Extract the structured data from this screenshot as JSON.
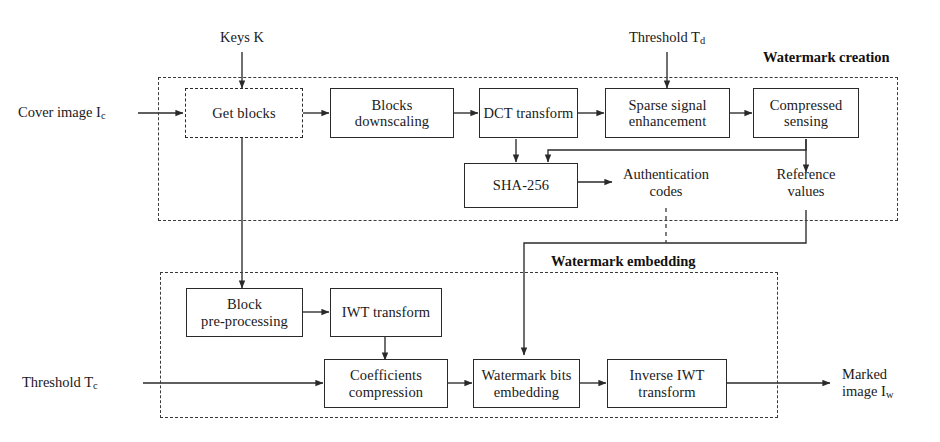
{
  "diagram": {
    "groups": [
      {
        "id": "watermark-creation",
        "label": "Watermark creation"
      },
      {
        "id": "watermark-embedding",
        "label": "Watermark embedding"
      }
    ],
    "nodes": [
      {
        "id": "get-blocks",
        "label": "Get blocks",
        "style": "dashed"
      },
      {
        "id": "blocks-downscaling",
        "label": "Blocks\ndownscaling",
        "style": "solid"
      },
      {
        "id": "dct-transform",
        "label": "DCT transform",
        "style": "solid"
      },
      {
        "id": "sparse-signal",
        "label": "Sparse signal\nenhancement",
        "style": "solid"
      },
      {
        "id": "compressed-sensing",
        "label": "Compressed\nsensing",
        "style": "solid"
      },
      {
        "id": "sha-256",
        "label": "SHA-256",
        "style": "solid"
      },
      {
        "id": "block-preprocessing",
        "label": "Block\npre-processing",
        "style": "solid"
      },
      {
        "id": "iwt-transform",
        "label": "IWT transform",
        "style": "solid"
      },
      {
        "id": "coefficients-compression",
        "label": "Coefficients\ncompression",
        "style": "solid"
      },
      {
        "id": "watermark-bits-embedding",
        "label": "Watermark bits\nembedding",
        "style": "solid"
      },
      {
        "id": "inverse-iwt-transform",
        "label": "Inverse IWT\ntransform",
        "style": "solid"
      }
    ],
    "labels": [
      {
        "id": "keys-k",
        "text": "Keys K"
      },
      {
        "id": "threshold-td",
        "text": "Threshold T",
        "sub": "d"
      },
      {
        "id": "cover-image",
        "text": "Cover image I",
        "sub": "c"
      },
      {
        "id": "authentication-codes",
        "text": "Authentication\ncodes"
      },
      {
        "id": "reference-values",
        "text": "Reference\nvalues"
      },
      {
        "id": "threshold-tc",
        "text": "Threshold T",
        "sub": "c"
      },
      {
        "id": "marked-image",
        "text": "Marked\nimage I",
        "sub": "w"
      }
    ],
    "edges": [
      {
        "from": "cover-image",
        "to": "get-blocks"
      },
      {
        "from": "keys-k",
        "to": "get-blocks"
      },
      {
        "from": "get-blocks",
        "to": "blocks-downscaling"
      },
      {
        "from": "get-blocks",
        "to": "block-preprocessing"
      },
      {
        "from": "blocks-downscaling",
        "to": "dct-transform"
      },
      {
        "from": "dct-transform",
        "to": "sparse-signal"
      },
      {
        "from": "dct-transform",
        "to": "sha-256"
      },
      {
        "from": "threshold-td",
        "to": "sparse-signal"
      },
      {
        "from": "sparse-signal",
        "to": "compressed-sensing"
      },
      {
        "from": "sparse-signal",
        "to": "sha-256"
      },
      {
        "from": "sha-256",
        "to": "authentication-codes"
      },
      {
        "from": "compressed-sensing",
        "to": "reference-values"
      },
      {
        "from": "reference-values",
        "to": "watermark-bits-embedding"
      },
      {
        "from": "block-preprocessing",
        "to": "iwt-transform"
      },
      {
        "from": "iwt-transform",
        "to": "coefficients-compression"
      },
      {
        "from": "threshold-tc",
        "to": "coefficients-compression"
      },
      {
        "from": "coefficients-compression",
        "to": "watermark-bits-embedding"
      },
      {
        "from": "watermark-bits-embedding",
        "to": "inverse-iwt-transform"
      },
      {
        "from": "inverse-iwt-transform",
        "to": "marked-image"
      }
    ],
    "colors": {
      "stroke": "#2a2a2a",
      "dashed_stroke": "#3a3a3a",
      "text": "#1a1a1a",
      "background": "#ffffff"
    }
  }
}
